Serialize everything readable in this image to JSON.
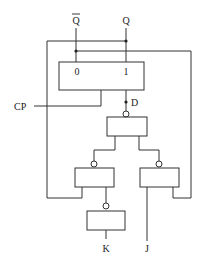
{
  "diagram": {
    "type": "logic-circuit",
    "outputs": [
      {
        "id": "qbar",
        "label": "Q",
        "overbar": true
      },
      {
        "id": "q",
        "label": "Q",
        "overbar": false
      }
    ],
    "flipflop": {
      "left_terminal": "0",
      "right_terminal": "1"
    },
    "clock_label": "CP",
    "d_label": "D",
    "inputs": [
      {
        "id": "k",
        "label": "K"
      },
      {
        "id": "j",
        "label": "J"
      }
    ],
    "colors": {
      "line": "#333333",
      "background": "#ffffff"
    }
  }
}
